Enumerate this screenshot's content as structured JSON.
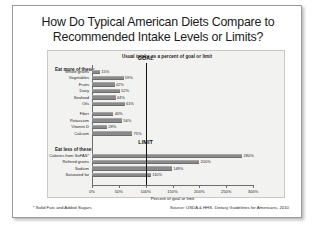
{
  "slide": {
    "title_line1": "How Do Typical American Diets Compare to",
    "title_line2": "Recommended Intake Levels or Limits?",
    "footnote": "* Solid Fats and Added Sugars",
    "source": "Source: USDA & HHS. Dietary Guidelines for Americans, 2010"
  },
  "chart_data": {
    "type": "bar",
    "orientation": "horizontal",
    "title": "Usual intake as a percent of goal or limit",
    "xlabel": "Percent of goal or limit",
    "ylabel": "",
    "xlim": [
      0,
      300
    ],
    "xticks": [
      0,
      50,
      100,
      150,
      200,
      250,
      300
    ],
    "xtick_labels": [
      "0%",
      "50%",
      "100%",
      "150%",
      "200%",
      "250%",
      "300%"
    ],
    "grid": false,
    "legend": "none",
    "bar_color": "#8a8a8a",
    "reference_lines": [
      {
        "label": "GOAL",
        "value": 100,
        "group": "eat_more",
        "color": "#111111"
      },
      {
        "label": "LIMIT",
        "value": 100,
        "group": "eat_less",
        "color": "#111111"
      }
    ],
    "groups": [
      {
        "name": "eat_more",
        "heading": "Eat more of these:",
        "categories": [
          "Whole grains",
          "Vegetables",
          "Fruits",
          "Dairy",
          "Seafood",
          "Oils",
          "Fiber",
          "Potassium",
          "Vitamin D",
          "Calcium"
        ],
        "values": [
          15,
          59,
          42,
          52,
          44,
          61,
          40,
          56,
          28,
          75
        ],
        "value_labels": [
          "15%",
          "59%",
          "42%",
          "52%",
          "44%",
          "61%",
          "40%",
          "56%",
          "28%",
          "75%"
        ]
      },
      {
        "name": "eat_less",
        "heading": "Eat less of these:",
        "categories": [
          "Calories from SoFAS*",
          "Refined grains",
          "Sodium",
          "Saturated fat"
        ],
        "values": [
          280,
          200,
          149,
          110
        ],
        "value_labels": [
          "280%",
          "200%",
          "149%",
          "110%"
        ]
      }
    ]
  }
}
